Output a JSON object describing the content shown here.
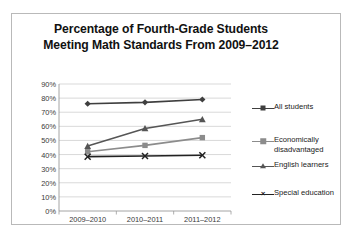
{
  "chart_data": {
    "type": "line",
    "title": "Percentage of Fourth-Grade Students Meeting Math Standards From 2009–2012",
    "title_line1": "Percentage of Fourth-Grade Students",
    "title_line2": "Meeting Math Standards From 2009–2012",
    "xlabel": "",
    "ylabel": "",
    "categories": [
      "2009–2010",
      "2010–2011",
      "2011–2012"
    ],
    "ylim": [
      0,
      90
    ],
    "ytick_step": 10,
    "ytick_labels": [
      "0%",
      "10%",
      "20%",
      "30%",
      "40%",
      "50%",
      "60%",
      "70%",
      "80%",
      "90%"
    ],
    "ytick_values": [
      0,
      10,
      20,
      30,
      40,
      50,
      60,
      70,
      80,
      90
    ],
    "grid": true,
    "grid_axis": "y",
    "legend_position": "right",
    "series": [
      {
        "name": "All students",
        "values": [
          76,
          77,
          79
        ],
        "marker": "diamond",
        "color": "#3f3f3f"
      },
      {
        "name": "Economically disadvantaged",
        "label_line1": "Economically",
        "label_line2": "disadvantaged",
        "values": [
          42,
          46.5,
          52
        ],
        "marker": "square",
        "color": "#8c8c8c"
      },
      {
        "name": "English learners",
        "values": [
          46,
          58.5,
          65
        ],
        "marker": "triangle",
        "color": "#555555"
      },
      {
        "name": "Special education",
        "values": [
          38.5,
          39,
          39.5
        ],
        "marker": "cross",
        "color": "#222222"
      }
    ]
  },
  "legend": {
    "items": [
      {
        "label": "All students"
      },
      {
        "label": "Economically\ndisadvantaged"
      },
      {
        "label": "English learners"
      },
      {
        "label": "Special education"
      }
    ]
  },
  "axis": {
    "y_labels": [
      "90%",
      "80%",
      "70%",
      "60%",
      "50%",
      "40%",
      "30%",
      "20%",
      "10%",
      "0%"
    ],
    "x_labels": [
      "2009–2010",
      "2010–2011",
      "2011–2012"
    ]
  },
  "colors": {
    "all_students": "#3f3f3f",
    "economically_disadvantaged": "#8c8c8c",
    "english_learners": "#555555",
    "special_education": "#222222",
    "grid": "#c8c8c8",
    "axis": "#9a9a9a",
    "frame": "#b9b9b9",
    "title": "#111111"
  }
}
